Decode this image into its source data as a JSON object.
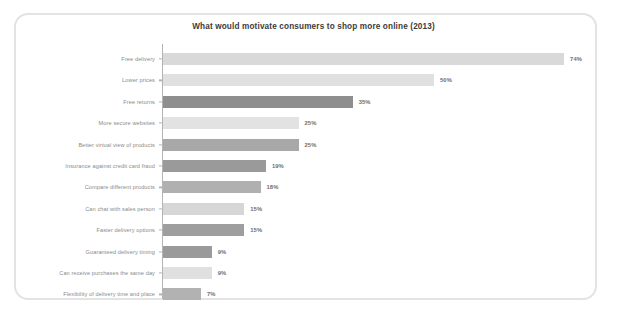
{
  "chart_data": {
    "type": "bar",
    "orientation": "horizontal",
    "title": "What would motivate consumers to shop more online (2013)",
    "xlabel": "",
    "ylabel": "",
    "xlim": [
      0,
      74
    ],
    "grid": false,
    "legend": null,
    "value_suffix": "%",
    "categories": [
      "Free delivery",
      "Lower prices",
      "Free returns",
      "More secure websites",
      "Better virtual view of products",
      "Insurance against credit card fraud",
      "Compare different products",
      "Can chat with sales person",
      "Faster delivery options",
      "Guaranteed delivery timing",
      "Can receive purchases the same day",
      "Flexibility of delivery time and place"
    ],
    "values": [
      74,
      50,
      35,
      25,
      25,
      19,
      18,
      15,
      15,
      9,
      9,
      7
    ],
    "value_labels": [
      "74%",
      "50%",
      "35%",
      "25%",
      "25%",
      "19%",
      "18%",
      "15%",
      "15%",
      "9%",
      "9%",
      "7%"
    ],
    "bar_colors": [
      "#d9d9d9",
      "#e0e0e0",
      "#8e8e8e",
      "#e2e2e2",
      "#a8a8a8",
      "#9a9a9a",
      "#b0b0b0",
      "#d6d6d6",
      "#9e9e9e",
      "#9a9a9a",
      "#e0e0e0",
      "#b2b2b2"
    ]
  },
  "colors": {
    "frame_border": "#e3e3e3",
    "axis": "#b4b4b4",
    "title_text": "#3b3b3b",
    "category_text": "#8a8a8a",
    "value_text": "#6d6d6d",
    "background": "#ffffff"
  }
}
